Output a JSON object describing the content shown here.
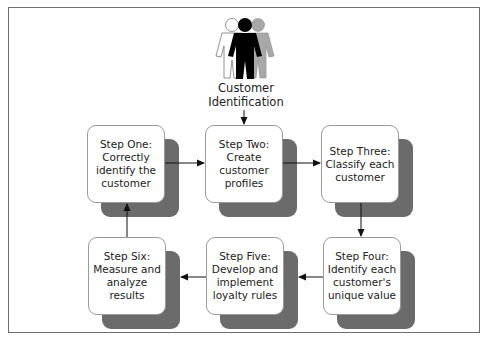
{
  "diagram": {
    "type": "process-cycle",
    "start": {
      "icon": "people-group-icon",
      "label_line1": "Customer",
      "label_line2": "Identification"
    },
    "steps": [
      {
        "id": 1,
        "text": "Step One:\nCorrectly\nidentify the\ncustomer"
      },
      {
        "id": 2,
        "text": "Step Two:\nCreate\ncustomer\nprofiles"
      },
      {
        "id": 3,
        "text": "Step Three:\nClassify each\ncustomer"
      },
      {
        "id": 4,
        "text": "Step Four:\nIdentify each\ncustomer's\nunique value"
      },
      {
        "id": 5,
        "text": "Step Five:\nDevelop and\nimplement\nloyalty rules"
      },
      {
        "id": 6,
        "text": "Step Six:\nMeasure and\nanalyze\nresults"
      }
    ],
    "flow": [
      {
        "from": "start",
        "to": 2
      },
      {
        "from": 1,
        "to": 2
      },
      {
        "from": 2,
        "to": 3
      },
      {
        "from": 3,
        "to": 4
      },
      {
        "from": 4,
        "to": 5
      },
      {
        "from": 5,
        "to": 6
      },
      {
        "from": 6,
        "to": 1
      }
    ],
    "colors": {
      "frame": "#6e6e6e",
      "shadow": "#6b6b6b",
      "box_fill": "#ffffff",
      "arrow": "#111111",
      "person_left": "#ffffff",
      "person_center": "#000000",
      "person_right": "#a8a8a8"
    }
  }
}
